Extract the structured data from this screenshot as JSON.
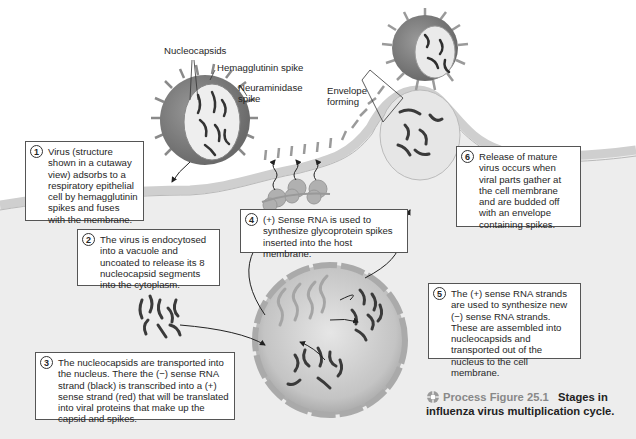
{
  "figure": {
    "caption_prefix": "Process Figure 25.1",
    "caption_title": "Stages in influenza virus multiplication cycle.",
    "icon": "process-figure-icon"
  },
  "labels": {
    "nucleocapsids": "Nucleocapsids",
    "hemagglutinin_spike": "Hemagglutinin spike",
    "neuraminidase_spike_line1": "Neuraminidase",
    "neuraminidase_spike_line2": "spike",
    "envelope_forming_line1": "Envelope",
    "envelope_forming_line2": "forming"
  },
  "steps": [
    {
      "number": "1",
      "text": "Virus (structure shown in a cutaway view) adsorbs to a respiratory epithelial cell by hemagglutinin spikes and fuses with the membrane."
    },
    {
      "number": "2",
      "text": "The virus is endocytosed into a vacuole and uncoated to release its 8 nucleocapsid segments into the cytoplasm."
    },
    {
      "number": "3",
      "text": "The nucleocapsids are transported into the nucleus. There the (−) sense RNA strand (black) is transcribed into a (+) sense strand (red) that will be translated into viral proteins that make up the capsid and spikes."
    },
    {
      "number": "4",
      "text": "(+) Sense RNA is used to synthesize glycoprotein spikes inserted into the host membrane."
    },
    {
      "number": "5",
      "text": "The (+) sense RNA strands are used to synthesize new (−) sense RNA strands. These are assembled into nucleocapsids and transported out of the nucleus to the cell membrane."
    },
    {
      "number": "6",
      "text": "Release of mature virus occurs when viral parts gather at the cell membrane and are budded off with an envelope containing spikes."
    }
  ],
  "colors": {
    "cell_fill": "#ececec",
    "membrane": "#c9c9c9",
    "nucleus": "#b8b8b8",
    "virus_envelope": "#8a8a8a",
    "rna_minus": "#3a3a3a",
    "rna_plus": "#a0a0a0"
  }
}
